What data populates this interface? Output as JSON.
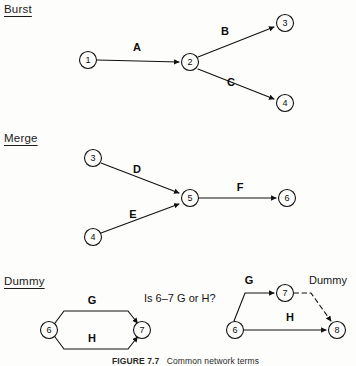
{
  "figure": {
    "caption_number": "FIGURE 7.7",
    "caption_text": "Common network terms"
  },
  "sections": {
    "burst": {
      "label": "Burst"
    },
    "merge": {
      "label": "Merge"
    },
    "dummy": {
      "label": "Dummy"
    }
  },
  "burst": {
    "nodes": [
      {
        "id": "n1",
        "label": "1",
        "x": 88,
        "y": 60
      },
      {
        "id": "n2",
        "label": "2",
        "x": 190,
        "y": 62
      },
      {
        "id": "n3",
        "label": "3",
        "x": 285,
        "y": 23
      },
      {
        "id": "n4",
        "label": "4",
        "x": 285,
        "y": 103
      }
    ],
    "edges": [
      {
        "id": "e-A",
        "label": "A",
        "from": "1",
        "to": "2",
        "style": "solid"
      },
      {
        "id": "e-B",
        "label": "B",
        "from": "2",
        "to": "3",
        "style": "solid"
      },
      {
        "id": "e-C",
        "label": "C",
        "from": "2",
        "to": "4",
        "style": "solid"
      }
    ]
  },
  "merge": {
    "nodes": [
      {
        "id": "n3",
        "label": "3",
        "x": 93,
        "y": 158
      },
      {
        "id": "n4",
        "label": "4",
        "x": 93,
        "y": 237
      },
      {
        "id": "n5",
        "label": "5",
        "x": 190,
        "y": 198
      },
      {
        "id": "n6",
        "label": "6",
        "x": 287,
        "y": 198
      }
    ],
    "edges": [
      {
        "id": "e-D",
        "label": "D",
        "from": "3",
        "to": "5",
        "style": "solid"
      },
      {
        "id": "e-E",
        "label": "E",
        "from": "4",
        "to": "5",
        "style": "solid"
      },
      {
        "id": "e-F",
        "label": "F",
        "from": "5",
        "to": "6",
        "style": "solid"
      }
    ]
  },
  "dummy_left": {
    "nodes": [
      {
        "id": "n6",
        "label": "6",
        "x": 49,
        "y": 330
      },
      {
        "id": "n7",
        "label": "7",
        "x": 142,
        "y": 330
      }
    ],
    "edges": [
      {
        "id": "e-G",
        "label": "G",
        "from": "6",
        "to": "7",
        "style": "solid"
      },
      {
        "id": "e-H",
        "label": "H",
        "from": "6",
        "to": "7",
        "style": "solid"
      }
    ]
  },
  "dummy_right": {
    "nodes": [
      {
        "id": "n6",
        "label": "6",
        "x": 235,
        "y": 330
      },
      {
        "id": "n7",
        "label": "7",
        "x": 285,
        "y": 293
      },
      {
        "id": "n8",
        "label": "8",
        "x": 337,
        "y": 330
      }
    ],
    "edges": [
      {
        "id": "e-G",
        "label": "G",
        "from": "6",
        "to": "7",
        "style": "solid"
      },
      {
        "id": "e-H",
        "label": "H",
        "from": "6",
        "to": "8",
        "style": "solid"
      },
      {
        "id": "e-dummy",
        "label": "Dummy",
        "from": "7",
        "to": "8",
        "style": "dashed"
      }
    ]
  },
  "question": {
    "text": "Is 6–7 G or H?"
  },
  "colors": {
    "stroke": "#111111",
    "text": "#0d0d0d",
    "background": "#fdfdfc"
  }
}
